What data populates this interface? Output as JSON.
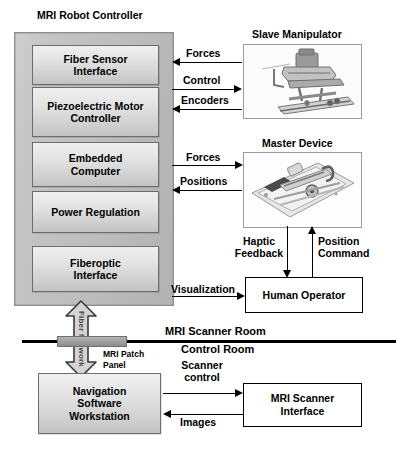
{
  "diagram": {
    "titles": {
      "controller": "MRI Robot Controller",
      "slave": "Slave Manipulator",
      "master": "Master Device"
    },
    "controller_modules": [
      {
        "label": "Fiber Sensor\nInterface"
      },
      {
        "label": "Piezoelectric Motor\nController"
      },
      {
        "label": "Embedded\nComputer"
      },
      {
        "label": "Power Regulation"
      },
      {
        "label": "Fiberoptic\nInterface"
      }
    ],
    "boxes": {
      "human_operator": "Human Operator",
      "navigation": "Navigation\nSoftware\nWorkstation",
      "scanner_interface": "MRI Scanner\nInterface"
    },
    "arrow_labels": {
      "forces_slave": "Forces",
      "control": "Control",
      "encoders": "Encoders",
      "forces_master": "Forces",
      "positions": "Positions",
      "haptic_feedback": "Haptic\nFeedback",
      "position_command": "Position\nCommand",
      "visualization": "Visualization",
      "scanner_control": "Scanner\ncontrol",
      "images": "Images"
    },
    "rooms": {
      "upper": "MRI Scanner Room",
      "lower": "Control Room"
    },
    "fiber": {
      "network_label": "Fiber Network",
      "patch_panel_label": "MRI Patch\nPanel"
    },
    "photos": {
      "slave": "slave-manipulator-photo",
      "master": "master-device-photo"
    },
    "colors": {
      "shell_fill": "#c4c4c4",
      "module_fill": "#e4e4e4",
      "line": "#000000",
      "patch_panel": "#9d9d9d"
    }
  }
}
